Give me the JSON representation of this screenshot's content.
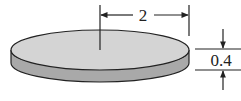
{
  "diagram": {
    "radius_label": "2",
    "height_label": "0.4",
    "colors": {
      "top_face": "#d4d4d4",
      "side_face": "#a9a9a9",
      "stroke": "#222222"
    }
  }
}
